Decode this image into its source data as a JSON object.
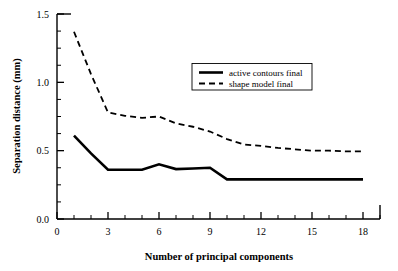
{
  "chart_data": {
    "type": "line",
    "title": "",
    "xlabel": "Number of principal components",
    "ylabel": "Separation distance (mm)",
    "xlim": [
      0,
      19
    ],
    "ylim": [
      0.0,
      1.5
    ],
    "grid": false,
    "legend_position": "upper-center",
    "x_ticks_major": [
      0,
      3,
      6,
      9,
      12,
      15,
      18
    ],
    "x_tick_labels": [
      "0",
      "3",
      "6",
      "9",
      "12",
      "15",
      "18"
    ],
    "x_ticks_minor": [
      1,
      2,
      4,
      5,
      7,
      8,
      10,
      11,
      13,
      14,
      16,
      17,
      19
    ],
    "y_ticks_major": [
      0.0,
      0.5,
      1.0,
      1.5
    ],
    "y_tick_labels": [
      "0.0",
      "0.5",
      "1.0",
      "1.5"
    ],
    "y_ticks_minor": [
      0.125,
      0.25,
      0.375,
      0.625,
      0.75,
      0.875,
      1.125,
      1.25,
      1.375
    ],
    "x": [
      1,
      2,
      3,
      4,
      5,
      6,
      7,
      8,
      9,
      10,
      11,
      12,
      13,
      14,
      15,
      16,
      17,
      18
    ],
    "series": [
      {
        "name": "active contours final",
        "style": "solid",
        "color": "#000000",
        "values": [
          0.61,
          0.48,
          0.36,
          0.36,
          0.36,
          0.4,
          0.365,
          0.37,
          0.375,
          0.29,
          0.29,
          0.29,
          0.29,
          0.29,
          0.29,
          0.29,
          0.29,
          0.29
        ]
      },
      {
        "name": "shape model final",
        "style": "dashed",
        "color": "#000000",
        "values": [
          1.37,
          1.06,
          0.78,
          0.755,
          0.74,
          0.75,
          0.7,
          0.675,
          0.64,
          0.585,
          0.545,
          0.535,
          0.52,
          0.51,
          0.5,
          0.5,
          0.495,
          0.495
        ]
      }
    ]
  },
  "legend": {
    "entries": [
      {
        "label": "active contours final",
        "style": "solid"
      },
      {
        "label": "shape model final",
        "style": "dashed"
      }
    ]
  }
}
